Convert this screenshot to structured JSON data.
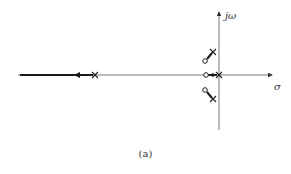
{
  "diagram": {
    "type": "root-locus",
    "axes": {
      "imag_label": "jω",
      "real_label": "σ"
    },
    "caption": "(a)",
    "poles": [
      {
        "id": "far-left-pole",
        "x": 95,
        "y": 75
      },
      {
        "id": "origin-pole",
        "x": 219,
        "y": 75
      },
      {
        "id": "upper-pole",
        "x": 213,
        "y": 52
      },
      {
        "id": "lower-pole",
        "x": 213,
        "y": 99
      }
    ],
    "zeros": [
      {
        "id": "real-zero",
        "x": 206,
        "y": 75
      },
      {
        "id": "upper-zero",
        "x": 205,
        "y": 61
      },
      {
        "id": "lower-zero",
        "x": 205,
        "y": 90
      }
    ],
    "colors": {
      "line": "#333333",
      "locus": "#1a1a1a"
    }
  }
}
